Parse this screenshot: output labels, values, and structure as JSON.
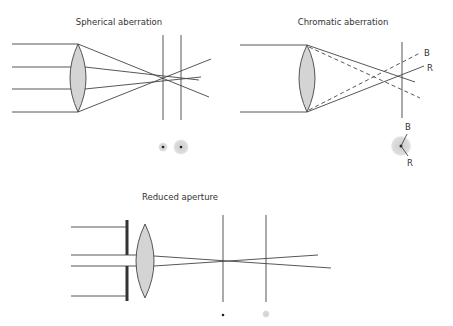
{
  "panels": {
    "spherical": {
      "title": "Spherical aberration",
      "spots": [
        "small-focused",
        "large-blurred"
      ]
    },
    "chromatic": {
      "title": "Chromatic aberration",
      "ray_labels": {
        "blue": "B",
        "red": "R"
      },
      "spot_labels": {
        "blue": "B",
        "red": "R"
      }
    },
    "reduced": {
      "title": "Reduced aperture",
      "spots": [
        "small-focused",
        "slightly-blurred"
      ]
    }
  },
  "colors": {
    "line": "#444444",
    "lens_fill": "#d4d4d4",
    "spot_blur": "#d8d8d8",
    "background": "#ffffff"
  }
}
